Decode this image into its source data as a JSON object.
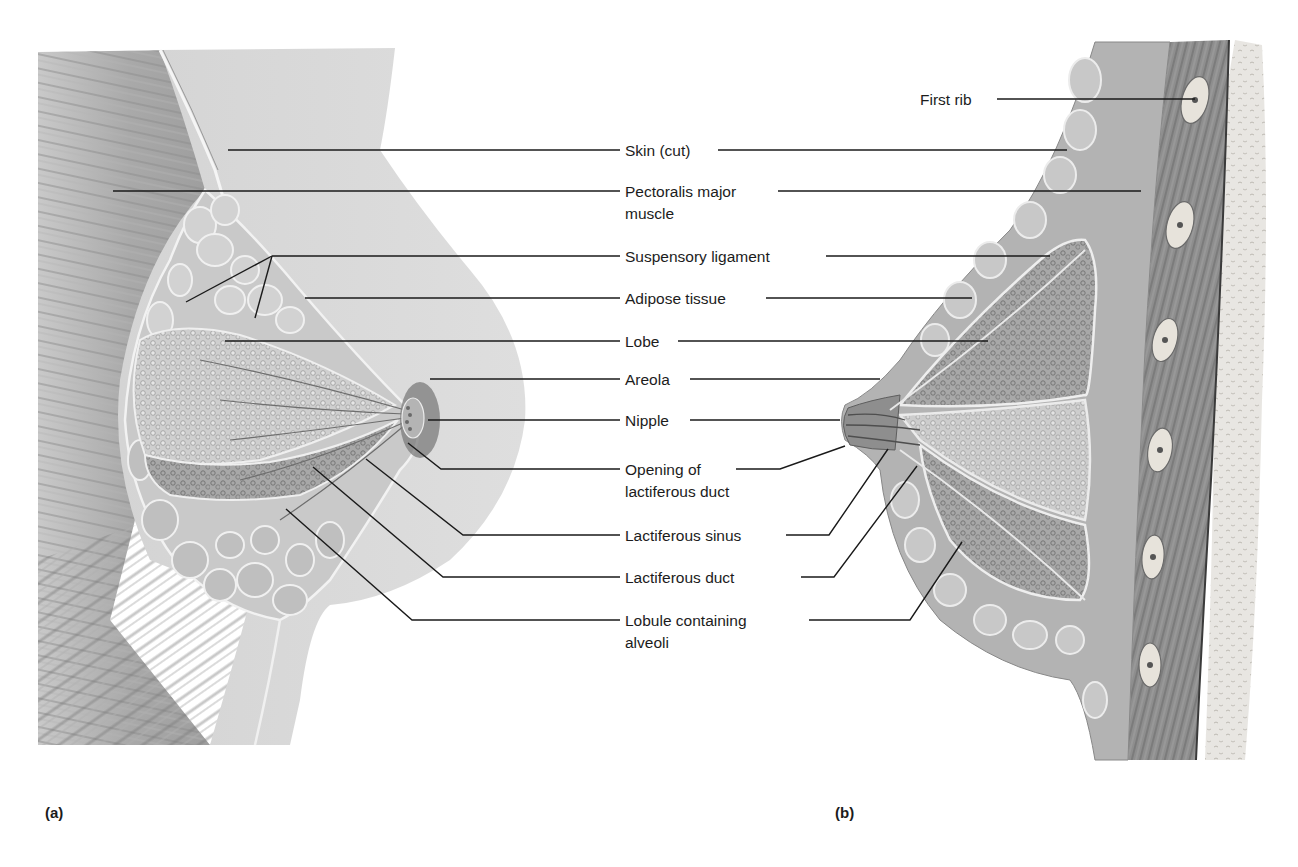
{
  "figure": {
    "panels": [
      {
        "id": "a",
        "letter": "(a)",
        "view": "anterior cutaway"
      },
      {
        "id": "b",
        "letter": "(b)",
        "view": "sagittal section"
      }
    ],
    "labels": {
      "first_rib": "First rib",
      "skin_cut": "Skin (cut)",
      "pectoralis_line1": "Pectoralis major",
      "pectoralis_line2": "muscle",
      "suspensory_ligament": "Suspensory ligament",
      "adipose_tissue": "Adipose tissue",
      "lobe": "Lobe",
      "areola": "Areola",
      "nipple": "Nipple",
      "opening_line1": "Opening of",
      "opening_line2": "lactiferous duct",
      "lactiferous_sinus": "Lactiferous sinus",
      "lactiferous_duct": "Lactiferous duct",
      "lobule_line1": "Lobule containing",
      "lobule_line2": "alveoli"
    },
    "colors": {
      "leader_line": "#1a1a1a",
      "muscle": "#8a8a8a",
      "skin": "#d9d9d9",
      "adipose": "#c4c4c4",
      "gland": "#9a9a9a",
      "rib": "#e6e2da",
      "background": "#ffffff"
    }
  }
}
